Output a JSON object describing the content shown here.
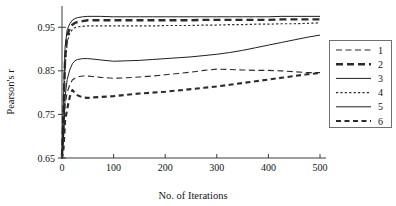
{
  "chart_data": {
    "type": "line",
    "title": "",
    "xlabel": "No. of Iterations",
    "ylabel": "Pearson's r",
    "xlim": [
      0,
      500
    ],
    "ylim": [
      0.65,
      0.985
    ],
    "grid": false,
    "legend_position": "right-outside",
    "xticks": [
      0,
      100,
      200,
      300,
      400,
      500
    ],
    "xtick_labels": [
      "0",
      "100",
      "200",
      "300",
      "400",
      "500"
    ],
    "yticks": [
      0.65,
      0.75,
      0.85,
      0.95
    ],
    "ytick_labels": [
      "0.65",
      "0.75",
      "0.85",
      "0.95"
    ],
    "legend_entries": [
      "1",
      "2",
      "3",
      "4",
      "5",
      "6"
    ],
    "x": [
      0,
      3,
      6,
      10,
      15,
      20,
      25,
      30,
      40,
      50,
      60,
      75,
      100,
      125,
      150,
      175,
      200,
      225,
      250,
      275,
      300,
      325,
      350,
      375,
      400,
      425,
      450,
      475,
      500
    ],
    "series": [
      {
        "name": "1",
        "style": "dashed-thin",
        "color": "#2b2b2b",
        "values": [
          0.652,
          0.7,
          0.772,
          0.8,
          0.818,
          0.829,
          0.833,
          0.836,
          0.838,
          0.838,
          0.837,
          0.835,
          0.833,
          0.834,
          0.836,
          0.838,
          0.841,
          0.844,
          0.847,
          0.851,
          0.854,
          0.853,
          0.852,
          0.851,
          0.851,
          0.85,
          0.848,
          0.846,
          0.846
        ]
      },
      {
        "name": "2",
        "style": "dashed-thick",
        "color": "#2b2b2b",
        "values": [
          0.654,
          0.76,
          0.88,
          0.93,
          0.948,
          0.956,
          0.96,
          0.962,
          0.964,
          0.966,
          0.966,
          0.966,
          0.966,
          0.966,
          0.966,
          0.966,
          0.966,
          0.966,
          0.966,
          0.967,
          0.967,
          0.967,
          0.967,
          0.967,
          0.967,
          0.968,
          0.968,
          0.968,
          0.968
        ]
      },
      {
        "name": "3",
        "style": "solid-thin-upper",
        "color": "#1f1f1f",
        "values": [
          0.656,
          0.79,
          0.905,
          0.944,
          0.958,
          0.966,
          0.97,
          0.972,
          0.974,
          0.975,
          0.975,
          0.975,
          0.974,
          0.974,
          0.974,
          0.974,
          0.974,
          0.974,
          0.974,
          0.974,
          0.974,
          0.974,
          0.974,
          0.974,
          0.974,
          0.975,
          0.975,
          0.975,
          0.975
        ]
      },
      {
        "name": "4",
        "style": "dotted-fine",
        "color": "#2b2b2b",
        "values": [
          0.65,
          0.735,
          0.86,
          0.915,
          0.936,
          0.945,
          0.949,
          0.951,
          0.952,
          0.953,
          0.953,
          0.953,
          0.953,
          0.953,
          0.953,
          0.953,
          0.954,
          0.954,
          0.954,
          0.955,
          0.955,
          0.956,
          0.956,
          0.957,
          0.957,
          0.958,
          0.958,
          0.959,
          0.96
        ]
      },
      {
        "name": "5",
        "style": "solid-thin-lower",
        "color": "#1f1f1f",
        "values": [
          0.651,
          0.7,
          0.79,
          0.83,
          0.852,
          0.866,
          0.873,
          0.876,
          0.878,
          0.878,
          0.877,
          0.875,
          0.872,
          0.873,
          0.874,
          0.876,
          0.878,
          0.88,
          0.882,
          0.885,
          0.888,
          0.892,
          0.897,
          0.903,
          0.909,
          0.915,
          0.921,
          0.927,
          0.932
        ]
      },
      {
        "name": "6",
        "style": "dash-dot-thick",
        "color": "#2b2b2b",
        "values": [
          0.648,
          0.672,
          0.735,
          0.762,
          0.79,
          0.806,
          0.8,
          0.794,
          0.789,
          0.788,
          0.789,
          0.79,
          0.792,
          0.795,
          0.798,
          0.8,
          0.802,
          0.805,
          0.808,
          0.811,
          0.814,
          0.818,
          0.822,
          0.826,
          0.83,
          0.834,
          0.838,
          0.842,
          0.845
        ]
      }
    ]
  }
}
